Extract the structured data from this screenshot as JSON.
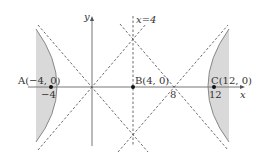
{
  "diagram": {
    "axes": {
      "x_label": "x",
      "y_label": "y"
    },
    "vertical_line_label": "x=4",
    "points": [
      {
        "name": "A",
        "label": "A(−4, 0)",
        "tick": "−4",
        "x": -4,
        "y": 0
      },
      {
        "name": "B",
        "label": "B(4, 0)",
        "x": 4,
        "y": 0
      },
      {
        "name": "C",
        "label": "C(12, 0)",
        "tick": "12",
        "x": 12,
        "y": 0
      }
    ],
    "tick_8": "8",
    "colors": {
      "shade": "#d9d9d9",
      "curve": "#888888",
      "axis": "#777777",
      "dash": "#444444",
      "point": "#111111"
    }
  }
}
